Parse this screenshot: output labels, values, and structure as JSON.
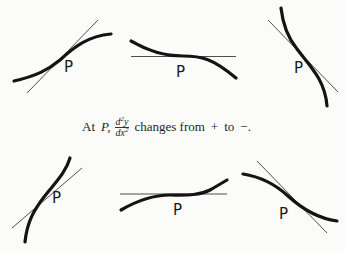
{
  "caption": {
    "prefix": "At",
    "point": "P,",
    "fraction_numerator_d": "d",
    "fraction_numerator_exp": "2",
    "fraction_numerator_var": "y",
    "fraction_denominator_dx": "dx",
    "fraction_denominator_exp": "2",
    "suffix_changes": "changes from",
    "sign_from": "+",
    "word_to": "to",
    "sign_to": "−."
  },
  "figures": [
    {
      "id": 1,
      "row": "top",
      "label": "P",
      "description": "S-curve rising, tangent crossing at inflection point P"
    },
    {
      "id": 2,
      "row": "top",
      "label": "P",
      "description": "Decreasing curve with horizontal tangent at inflection point P"
    },
    {
      "id": 3,
      "row": "top",
      "label": "P",
      "description": "Steep decreasing curve with tangent crossing at P"
    },
    {
      "id": 4,
      "row": "bottom",
      "label": "P",
      "description": "Steep rising curve with tangent crossing at P"
    },
    {
      "id": 5,
      "row": "bottom",
      "label": "P",
      "description": "Increasing curve with horizontal tangent at inflection point P"
    },
    {
      "id": 6,
      "row": "bottom",
      "label": "P",
      "description": "Decreasing curve with tangent crossing at inflection point P"
    }
  ],
  "colors": {
    "curve": "#141414",
    "tangent": "#3a3a3a",
    "background": "#fbfbfa"
  }
}
